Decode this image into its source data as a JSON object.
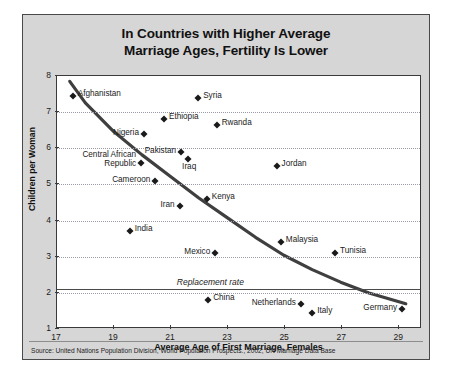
{
  "figure": {
    "title_line1": "In Countries with Higher Average",
    "title_line2": "Marriage Ages, Fertility Is Lower",
    "source": "Source: United Nations Population Division, World Population Prospects., 2002; UN Marriage Data Base"
  },
  "chart_data": {
    "type": "scatter",
    "title": "In Countries with Higher Average Marriage Ages, Fertility Is Lower",
    "xlabel": "Average Age of First Marriage, Females",
    "ylabel": "Children per Woman",
    "xlim": [
      17,
      29.8
    ],
    "ylim": [
      1,
      8
    ],
    "xticks": [
      17,
      19,
      21,
      23,
      25,
      27,
      29
    ],
    "yticks": [
      1,
      2,
      3,
      4,
      5,
      6,
      7,
      8
    ],
    "grid": "horizontal-dotted",
    "legend": "none",
    "annotations": [
      {
        "text": "Replacement rate",
        "y": 2.1,
        "x": 21.2,
        "style": "italic",
        "line": true
      }
    ],
    "trendline": {
      "description": "Smooth decreasing curve from upper-left to lower-right",
      "points": [
        [
          17.45,
          7.85
        ],
        [
          18.0,
          7.25
        ],
        [
          19.0,
          6.45
        ],
        [
          20.0,
          5.8
        ],
        [
          21.0,
          5.2
        ],
        [
          22.0,
          4.6
        ],
        [
          23.0,
          4.05
        ],
        [
          24.0,
          3.5
        ],
        [
          25.0,
          3.0
        ],
        [
          26.0,
          2.6
        ],
        [
          27.0,
          2.25
        ],
        [
          28.0,
          1.95
        ],
        [
          29.3,
          1.65
        ]
      ]
    },
    "points": [
      {
        "label": "Afghanistan",
        "x": 17.55,
        "y": 7.45,
        "label_pos": "right"
      },
      {
        "label": "Syria",
        "x": 21.95,
        "y": 7.4,
        "label_pos": "right"
      },
      {
        "label": "Ethiopia",
        "x": 20.75,
        "y": 6.8,
        "label_pos": "right"
      },
      {
        "label": "Rwanda",
        "x": 22.6,
        "y": 6.65,
        "label_pos": "right"
      },
      {
        "label": "Nigeria",
        "x": 20.05,
        "y": 6.4,
        "label_pos": "left"
      },
      {
        "label": "Pakistan",
        "x": 21.35,
        "y": 5.9,
        "label_pos": "left"
      },
      {
        "label": "Iraq",
        "x": 21.6,
        "y": 5.7,
        "label_pos": "below"
      },
      {
        "label": "Central African Republic",
        "x": 19.95,
        "y": 5.6,
        "label_pos": "left-2line"
      },
      {
        "label": "Jordan",
        "x": 24.7,
        "y": 5.5,
        "label_pos": "right"
      },
      {
        "label": "Cameroon",
        "x": 20.45,
        "y": 5.1,
        "label_pos": "left"
      },
      {
        "label": "Kenya",
        "x": 22.25,
        "y": 4.6,
        "label_pos": "right"
      },
      {
        "label": "Iran",
        "x": 21.3,
        "y": 4.4,
        "label_pos": "left"
      },
      {
        "label": "India",
        "x": 19.55,
        "y": 3.7,
        "label_pos": "right"
      },
      {
        "label": "Malaysia",
        "x": 24.85,
        "y": 3.4,
        "label_pos": "right"
      },
      {
        "label": "Tunisia",
        "x": 26.75,
        "y": 3.1,
        "label_pos": "right"
      },
      {
        "label": "Mexico",
        "x": 22.55,
        "y": 3.1,
        "label_pos": "left"
      },
      {
        "label": "China",
        "x": 22.3,
        "y": 1.8,
        "label_pos": "right"
      },
      {
        "label": "Netherlands",
        "x": 25.55,
        "y": 1.7,
        "label_pos": "left"
      },
      {
        "label": "Italy",
        "x": 25.95,
        "y": 1.45,
        "label_pos": "right"
      },
      {
        "label": "Germany",
        "x": 29.1,
        "y": 1.55,
        "label_pos": "left"
      }
    ]
  }
}
